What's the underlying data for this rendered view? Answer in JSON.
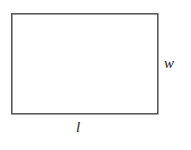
{
  "figure": {
    "type": "geometry-diagram",
    "background_color": "#ffffff",
    "shape": {
      "name": "rectangle",
      "stroke_color": "#5a5a5a",
      "fill_color": "#ffffff",
      "stroke_width": 1.6,
      "x": 11,
      "y": 13,
      "width": 147,
      "height": 101
    },
    "labels": {
      "width_label": "w",
      "length_label": "l"
    },
    "label_color": "#1c1c1c"
  }
}
